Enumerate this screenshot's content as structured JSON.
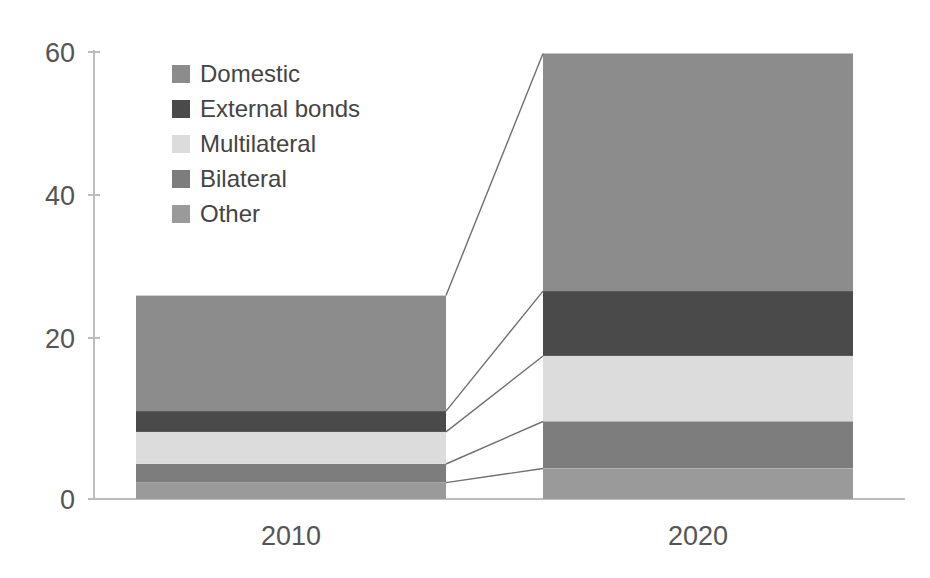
{
  "chart_data": {
    "type": "bar",
    "variant": "stacked-column",
    "title": "",
    "subtitle": "",
    "xlabel": "",
    "ylabel": "",
    "categories": [
      "2010",
      "2020"
    ],
    "x_tick_labels": [
      "2010",
      "2020"
    ],
    "y_tick_labels": [
      "0",
      "20",
      "40",
      "60"
    ],
    "y_ticks": [
      0,
      20,
      40,
      60
    ],
    "ylim": [
      0,
      60
    ],
    "grid": false,
    "legend_position": "top-left-inside",
    "annotations": [
      "connector lines linking 2010 segment boundaries to 2020 segment boundaries"
    ],
    "series": [
      {
        "name": "Domestic",
        "color": "#8c8c8c",
        "values": [
          15.5,
          31.9
        ]
      },
      {
        "name": "External bonds",
        "color": "#4a4a4a",
        "values": [
          2.8,
          8.7
        ]
      },
      {
        "name": "Multilateral",
        "color": "#dcdcdc",
        "values": [
          4.3,
          8.8
        ]
      },
      {
        "name": "Bilateral",
        "color": "#7d7d7d",
        "values": [
          2.5,
          6.3
        ]
      },
      {
        "name": "Other",
        "color": "#9a9a9a",
        "values": [
          2.2,
          4.1
        ]
      }
    ],
    "totals": [
      27.3,
      59.8
    ],
    "stack_order_bottom_to_top": [
      "Other",
      "Bilateral",
      "Multilateral",
      "External bonds",
      "Domestic"
    ]
  },
  "legend": {
    "items": [
      {
        "label": "Domestic",
        "swatch": "#8c8c8c"
      },
      {
        "label": "External bonds",
        "swatch": "#4a4a4a"
      },
      {
        "label": "Multilateral",
        "swatch": "#dcdcdc"
      },
      {
        "label": "Bilateral",
        "swatch": "#7d7d7d"
      },
      {
        "label": "Other",
        "swatch": "#9a9a9a"
      }
    ]
  },
  "axes": {
    "y_labels": [
      "60",
      "40",
      "20",
      "0"
    ],
    "x_labels": [
      "2010",
      "2020"
    ]
  },
  "colors": {
    "axis": "#bdbdbd",
    "text": "#555555",
    "leader": "#6f6f6f",
    "background": "#ffffff"
  }
}
